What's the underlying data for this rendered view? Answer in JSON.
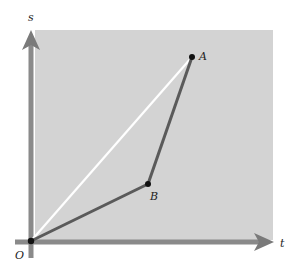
{
  "figure": {
    "axes": {
      "vertical_label": "s",
      "horizontal_label": "t"
    },
    "points": {
      "origin": {
        "label": "O",
        "x": 30,
        "y": 241
      },
      "a": {
        "label": "A",
        "x": 192,
        "y": 57
      },
      "b": {
        "label": "B",
        "x": 148,
        "y": 184
      }
    },
    "segments": [
      {
        "from": "O",
        "to": "A",
        "style": "white"
      },
      {
        "from": "O",
        "to": "B",
        "style": "dark"
      },
      {
        "from": "B",
        "to": "A",
        "style": "dark"
      }
    ],
    "colors": {
      "panel": "#d3d3d3",
      "axis": "#8a8a8a",
      "dark_path": "#555555",
      "chord": "#ffffff",
      "point": "#111111"
    }
  }
}
